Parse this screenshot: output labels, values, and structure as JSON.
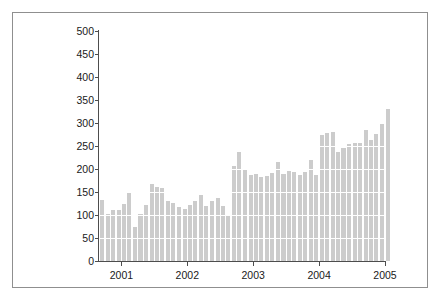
{
  "figure": {
    "background": "#ffffff",
    "border_color": "#8f8f8f",
    "axis_color": "#4d4d4d"
  },
  "chart_data": {
    "type": "bar",
    "title": "",
    "xlabel": "",
    "ylabel": "Thousands of Units",
    "ylim": [
      0,
      500
    ],
    "yticks": [
      0,
      50,
      100,
      150,
      200,
      250,
      300,
      350,
      400,
      450,
      500
    ],
    "ytick_labels": [
      "0",
      "50",
      "100",
      "150",
      "200",
      "250",
      "300",
      "350",
      "400",
      "450",
      "500"
    ],
    "xticks": [
      2001,
      2002,
      2003,
      2004,
      2005
    ],
    "xtick_labels": [
      "2001",
      "2002",
      "2003",
      "2004",
      "2005"
    ],
    "xlim": [
      2000.66,
      2005.0
    ],
    "grid": "horizontal-white",
    "bar_color": "#cccccc",
    "legend": "none",
    "x": [
      2000.71,
      2000.79,
      2000.87,
      2000.96,
      2001.04,
      2001.12,
      2001.21,
      2001.29,
      2001.37,
      2001.46,
      2001.54,
      2001.62,
      2001.71,
      2001.79,
      2001.87,
      2001.96,
      2002.04,
      2002.12,
      2002.21,
      2002.29,
      2002.37,
      2002.46,
      2002.54,
      2002.62,
      2002.71,
      2002.79,
      2002.87,
      2002.96,
      2003.04,
      2003.12,
      2003.21,
      2003.29,
      2003.37,
      2003.46,
      2003.54,
      2003.62,
      2003.71,
      2003.79,
      2003.87,
      2003.96,
      2004.04,
      2004.12,
      2004.21,
      2004.29,
      2004.37,
      2004.46,
      2004.54,
      2004.62,
      2004.71,
      2004.79,
      2004.87,
      2004.96
    ],
    "categories": [
      "2000-09",
      "2000-10",
      "2000-11",
      "2000-12",
      "2001-01",
      "2001-02",
      "2001-03",
      "2001-04",
      "2001-05",
      "2001-06",
      "2001-07",
      "2001-08",
      "2001-09",
      "2001-10",
      "2001-11",
      "2001-12",
      "2002-01",
      "2002-02",
      "2002-03",
      "2002-04",
      "2002-05",
      "2002-06",
      "2002-07",
      "2002-08",
      "2002-09",
      "2002-10",
      "2002-11",
      "2002-12",
      "2003-01",
      "2003-02",
      "2003-03",
      "2003-04",
      "2003-05",
      "2003-06",
      "2003-07",
      "2003-08",
      "2003-09",
      "2003-10",
      "2003-11",
      "2003-12",
      "2004-01",
      "2004-02",
      "2004-03",
      "2004-04",
      "2004-05",
      "2004-06",
      "2004-07",
      "2004-08",
      "2004-09",
      "2004-10",
      "2004-11",
      "2004-12"
    ],
    "values": [
      133,
      103,
      110,
      111,
      124,
      148,
      74,
      102,
      121,
      167,
      161,
      158,
      130,
      127,
      117,
      114,
      122,
      130,
      143,
      119,
      131,
      136,
      119,
      101,
      207,
      236,
      200,
      187,
      190,
      183,
      185,
      192,
      215,
      190,
      196,
      193,
      188,
      193,
      219,
      186,
      273,
      278,
      281,
      237,
      246,
      255,
      257,
      257,
      285,
      264,
      276,
      298
    ],
    "values_continued": [
      330,
      288,
      221,
      322,
      406,
      375,
      294,
      294,
      286,
      271,
      268,
      337,
      299,
      311,
      340,
      297,
      377
    ],
    "series_note": "monthly units, thousands",
    "max_value": 406,
    "min_value": 74
  }
}
